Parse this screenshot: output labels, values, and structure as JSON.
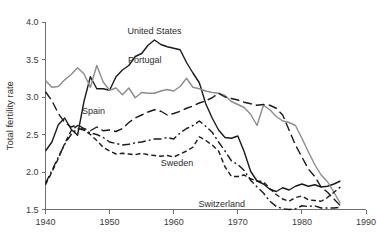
{
  "chart_data": {
    "type": "line",
    "title": "",
    "xlabel": "",
    "ylabel": "Total fertility rate",
    "xlim": [
      1940,
      1990
    ],
    "ylim": [
      1.5,
      4.0
    ],
    "xticks": [
      1940,
      1950,
      1960,
      1970,
      1980,
      1990
    ],
    "xticklabels": [
      "1940",
      "1950",
      "1960",
      "1970",
      "1980",
      "1990"
    ],
    "yticks": [
      1.5,
      2.0,
      2.5,
      3.0,
      3.5,
      4.0
    ],
    "yticklabels": [
      "1.5",
      "2.0",
      "2.5",
      "3.0",
      "3.5",
      "4.0"
    ],
    "grid": false,
    "legend_position": "inline-annotations",
    "annotations": [
      {
        "text": "United States",
        "x": 1957.0,
        "y": 3.88
      },
      {
        "text": "Portugal",
        "x": 1955.5,
        "y": 3.5
      },
      {
        "text": "Spain",
        "x": 1947.5,
        "y": 2.82
      },
      {
        "text": "Sweden",
        "x": 1960.5,
        "y": 2.12
      },
      {
        "text": "Switzerland",
        "x": 1967.5,
        "y": 1.57
      }
    ],
    "series": [
      {
        "name": "United States",
        "color": "#1a1a1a",
        "style": "solid",
        "x": [
          1940,
          1941,
          1942,
          1943,
          1944,
          1945,
          1946,
          1947,
          1948,
          1949,
          1950,
          1951,
          1952,
          1953,
          1954,
          1955,
          1956,
          1957,
          1958,
          1959,
          1960,
          1961,
          1962,
          1963,
          1964,
          1965,
          1966,
          1967,
          1968,
          1969,
          1970,
          1971,
          1972,
          1973,
          1974,
          1975,
          1976,
          1977,
          1978,
          1979,
          1980,
          1981,
          1982,
          1983,
          1984,
          1985,
          1986
        ],
        "values": [
          2.28,
          2.4,
          2.63,
          2.72,
          2.57,
          2.49,
          2.94,
          3.27,
          3.11,
          3.11,
          3.09,
          3.27,
          3.36,
          3.42,
          3.54,
          3.58,
          3.69,
          3.76,
          3.7,
          3.67,
          3.65,
          3.63,
          3.46,
          3.32,
          3.19,
          2.91,
          2.72,
          2.56,
          2.46,
          2.45,
          2.48,
          2.27,
          2.01,
          1.88,
          1.84,
          1.77,
          1.74,
          1.79,
          1.76,
          1.81,
          1.84,
          1.81,
          1.83,
          1.8,
          1.81,
          1.84,
          1.88
        ]
      },
      {
        "name": "Portugal",
        "color": "#8c8c8c",
        "style": "solid",
        "x": [
          1940,
          1941,
          1942,
          1943,
          1944,
          1945,
          1946,
          1947,
          1948,
          1949,
          1950,
          1951,
          1952,
          1953,
          1954,
          1955,
          1956,
          1957,
          1958,
          1959,
          1960,
          1961,
          1962,
          1963,
          1964,
          1965,
          1966,
          1967,
          1968,
          1969,
          1970,
          1971,
          1972,
          1973,
          1974,
          1975,
          1976,
          1977,
          1978,
          1979,
          1980,
          1981,
          1982,
          1983,
          1984,
          1985,
          1986
        ],
        "values": [
          3.22,
          3.13,
          3.14,
          3.23,
          3.3,
          3.39,
          3.31,
          3.13,
          3.42,
          3.2,
          3.09,
          3.12,
          3.03,
          3.12,
          2.99,
          3.06,
          3.05,
          3.05,
          3.08,
          3.1,
          3.08,
          3.14,
          3.25,
          3.13,
          3.11,
          3.08,
          3.06,
          3.05,
          3.02,
          2.94,
          2.9,
          2.86,
          2.77,
          2.62,
          2.89,
          2.83,
          2.74,
          2.68,
          2.66,
          2.62,
          2.45,
          2.27,
          2.1,
          1.96,
          1.87,
          1.73,
          1.58
        ]
      },
      {
        "name": "Spain",
        "color": "#1a1a1a",
        "style": "longdash",
        "x": [
          1940,
          1941,
          1942,
          1943,
          1944,
          1945,
          1946,
          1947,
          1948,
          1949,
          1950,
          1951,
          1952,
          1953,
          1954,
          1955,
          1956,
          1957,
          1958,
          1959,
          1960,
          1961,
          1962,
          1963,
          1964,
          1965,
          1966,
          1967,
          1968,
          1969,
          1970,
          1971,
          1972,
          1973,
          1974,
          1975,
          1976,
          1977,
          1978,
          1979,
          1980,
          1981,
          1982,
          1983,
          1984,
          1985,
          1986
        ],
        "values": [
          3.07,
          2.95,
          2.78,
          2.66,
          2.6,
          2.63,
          2.58,
          2.55,
          2.6,
          2.55,
          2.56,
          2.54,
          2.58,
          2.66,
          2.72,
          2.76,
          2.8,
          2.83,
          2.81,
          2.76,
          2.78,
          2.81,
          2.85,
          2.88,
          2.92,
          2.95,
          2.99,
          3.05,
          3.0,
          2.98,
          2.96,
          2.93,
          2.91,
          2.89,
          2.9,
          2.89,
          2.85,
          2.76,
          2.56,
          2.36,
          2.2,
          2.04,
          1.94,
          1.8,
          1.73,
          1.64,
          1.55
        ]
      },
      {
        "name": "Sweden",
        "color": "#1a1a1a",
        "style": "dash",
        "x": [
          1940,
          1941,
          1942,
          1943,
          1944,
          1945,
          1946,
          1947,
          1948,
          1949,
          1950,
          1951,
          1952,
          1953,
          1954,
          1955,
          1956,
          1957,
          1958,
          1959,
          1960,
          1961,
          1962,
          1963,
          1964,
          1965,
          1966,
          1967,
          1968,
          1969,
          1970,
          1971,
          1972,
          1973,
          1974,
          1975,
          1976,
          1977,
          1978,
          1979,
          1980,
          1981,
          1982,
          1983,
          1984,
          1985,
          1986
        ],
        "values": [
          1.83,
          2.0,
          2.18,
          2.38,
          2.55,
          2.62,
          2.56,
          2.5,
          2.42,
          2.33,
          2.28,
          2.24,
          2.25,
          2.24,
          2.23,
          2.25,
          2.23,
          2.22,
          2.21,
          2.22,
          2.2,
          2.24,
          2.28,
          2.33,
          2.47,
          2.42,
          2.36,
          2.28,
          2.07,
          1.94,
          1.94,
          1.96,
          1.91,
          1.88,
          1.87,
          1.78,
          1.7,
          1.64,
          1.61,
          1.66,
          1.68,
          1.63,
          1.62,
          1.61,
          1.66,
          1.73,
          1.8
        ]
      },
      {
        "name": "Switzerland",
        "color": "#1a1a1a",
        "style": "dashdot",
        "x": [
          1940,
          1941,
          1942,
          1943,
          1944,
          1945,
          1946,
          1947,
          1948,
          1949,
          1950,
          1951,
          1952,
          1953,
          1954,
          1955,
          1956,
          1957,
          1958,
          1959,
          1960,
          1961,
          1962,
          1963,
          1964,
          1965,
          1966,
          1967,
          1968,
          1969,
          1970,
          1971,
          1972,
          1973,
          1974,
          1975,
          1976,
          1977,
          1978,
          1979,
          1980,
          1981,
          1982,
          1983,
          1984,
          1985,
          1986
        ],
        "values": [
          1.85,
          2.02,
          2.2,
          2.37,
          2.5,
          2.58,
          2.56,
          2.52,
          2.5,
          2.46,
          2.4,
          2.38,
          2.36,
          2.37,
          2.39,
          2.4,
          2.42,
          2.44,
          2.44,
          2.46,
          2.44,
          2.52,
          2.58,
          2.62,
          2.68,
          2.61,
          2.53,
          2.4,
          2.28,
          2.15,
          2.1,
          2.02,
          1.89,
          1.8,
          1.72,
          1.61,
          1.54,
          1.51,
          1.5,
          1.51,
          1.55,
          1.54,
          1.55,
          1.52,
          1.52,
          1.52,
          1.53
        ]
      }
    ]
  }
}
